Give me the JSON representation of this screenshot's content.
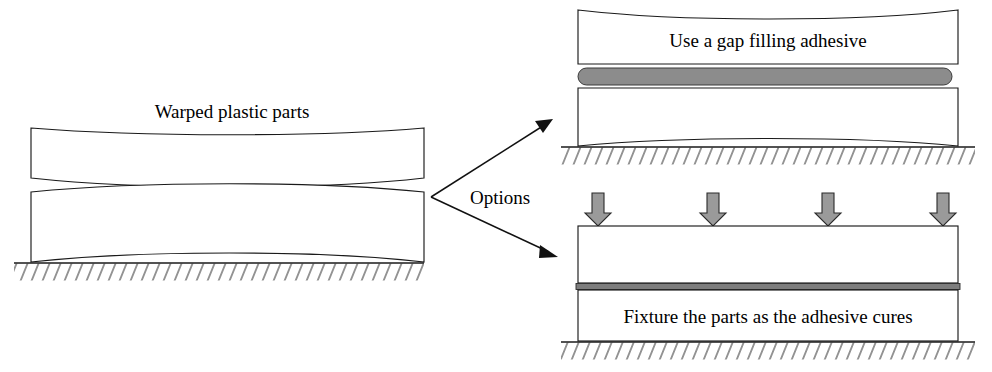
{
  "figure": {
    "title_visible": false,
    "background_color": "#ffffff",
    "ink_color": "#1a1a1a",
    "adhesive_bead_color": "#8c8c8c",
    "load_arrow_color": "#9a9a9a"
  },
  "labels": {
    "warped_parts": "Warped plastic parts",
    "options": "Options",
    "gap_filling": "Use a gap filling adhesive",
    "fixture": "Fixture the parts as the adhesive cures"
  },
  "panels": {
    "left": {
      "name": "warped-parts-panel",
      "caption": "Warped plastic parts",
      "part_count": 2,
      "ground": true
    },
    "top_right": {
      "name": "gap-filling-adhesive-panel",
      "caption": "Use a gap filling adhesive",
      "part_count": 2,
      "adhesive": "thick-bead",
      "ground": true
    },
    "bottom_right": {
      "name": "fixture-parts-panel",
      "caption": "Fixture the parts as the adhesive cures",
      "part_count": 2,
      "adhesive": "thin-bondline",
      "ground": true,
      "load_arrows": 4
    }
  },
  "flow": {
    "branch_label": "Options",
    "branches": [
      {
        "name": "branch-to-gap-filling",
        "target": "gap-filling-adhesive-panel"
      },
      {
        "name": "branch-to-fixture",
        "target": "fixture-parts-panel"
      }
    ]
  },
  "icons": {
    "down_arrow": "down-arrow-icon",
    "flow_arrow": "flow-arrow-icon",
    "hatch": "ground-hatch-icon"
  }
}
